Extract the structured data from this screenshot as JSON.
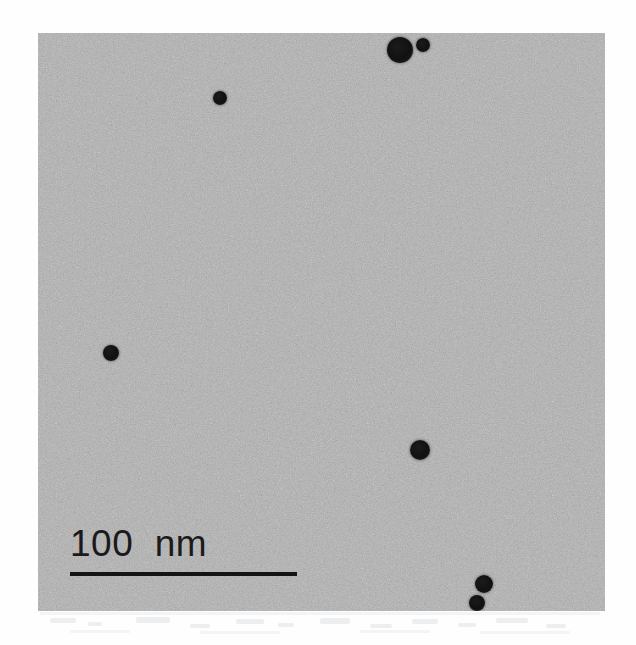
{
  "figure": {
    "type": "tem-micrograph",
    "caption_text": "",
    "plate": {
      "x": 38,
      "y": 33,
      "width": 567,
      "height": 578,
      "background_color": "#b2b2b2",
      "page_background_color": "#ffffff"
    }
  },
  "scalebar": {
    "label": "100  nm",
    "value": "100",
    "unit": "nm",
    "bar_color": "#141414",
    "text_color": "#1a1a1a",
    "bar_length_px": 227,
    "bar_x": 70,
    "bar_y": 572,
    "label_x": 70,
    "label_y": 524
  },
  "particles": [
    {
      "name": "particle-top-large",
      "cx": 400,
      "cy": 50,
      "r": 13
    },
    {
      "name": "particle-top-small",
      "cx": 423,
      "cy": 45,
      "r": 7
    },
    {
      "name": "particle-upper-left",
      "cx": 220,
      "cy": 98,
      "r": 7
    },
    {
      "name": "particle-mid-left",
      "cx": 111,
      "cy": 353,
      "r": 8
    },
    {
      "name": "particle-center-right",
      "cx": 420,
      "cy": 450,
      "r": 10
    },
    {
      "name": "particle-bottom-upper",
      "cx": 484,
      "cy": 584,
      "r": 9
    },
    {
      "name": "particle-bottom-lower",
      "cx": 477,
      "cy": 603,
      "r": 8
    }
  ],
  "colors": {
    "particle_dark": "#111111",
    "background_grey": "#b2b2b2",
    "page_white": "#ffffff",
    "noise_light": "#cfcfcf",
    "noise_dark": "#969696"
  }
}
